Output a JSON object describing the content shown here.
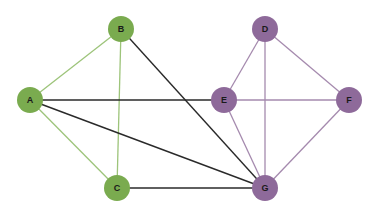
{
  "diagram": {
    "type": "graph",
    "colors": {
      "green_node": "#7aab4f",
      "green_edge": "#9dc47a",
      "purple_node": "#8e6a9a",
      "purple_edge": "#a58aae",
      "black_edge": "#2a2a2a"
    },
    "nodes": [
      {
        "id": "A",
        "label": "A",
        "x": 30,
        "y": 100,
        "group": "green"
      },
      {
        "id": "B",
        "label": "B",
        "x": 121,
        "y": 29,
        "group": "green"
      },
      {
        "id": "C",
        "label": "C",
        "x": 117,
        "y": 188,
        "group": "green"
      },
      {
        "id": "D",
        "label": "D",
        "x": 265,
        "y": 29,
        "group": "purple"
      },
      {
        "id": "E",
        "label": "E",
        "x": 224,
        "y": 100,
        "group": "purple"
      },
      {
        "id": "F",
        "label": "F",
        "x": 349,
        "y": 100,
        "group": "purple"
      },
      {
        "id": "G",
        "label": "G",
        "x": 265,
        "y": 188,
        "group": "purple"
      }
    ],
    "edges": [
      {
        "from": "A",
        "to": "B",
        "color": "green"
      },
      {
        "from": "A",
        "to": "C",
        "color": "green"
      },
      {
        "from": "B",
        "to": "C",
        "color": "green"
      },
      {
        "from": "A",
        "to": "E",
        "color": "black"
      },
      {
        "from": "A",
        "to": "G",
        "color": "black"
      },
      {
        "from": "B",
        "to": "G",
        "color": "black"
      },
      {
        "from": "C",
        "to": "G",
        "color": "black"
      },
      {
        "from": "D",
        "to": "E",
        "color": "purple"
      },
      {
        "from": "D",
        "to": "F",
        "color": "purple"
      },
      {
        "from": "D",
        "to": "G",
        "color": "purple"
      },
      {
        "from": "E",
        "to": "F",
        "color": "purple"
      },
      {
        "from": "E",
        "to": "G",
        "color": "purple"
      },
      {
        "from": "F",
        "to": "G",
        "color": "purple"
      }
    ]
  }
}
